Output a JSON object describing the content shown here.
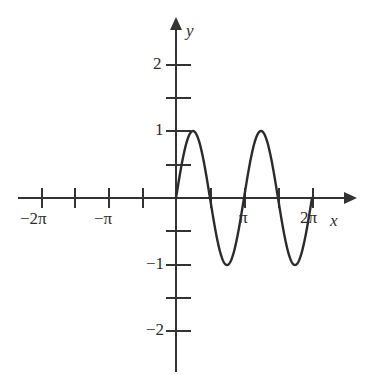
{
  "figure": {
    "background_color": "#ffffff",
    "stroke_color": "#333333",
    "curve_color": "#2b2b2b"
  },
  "axes": {
    "x_axis_label": "x",
    "y_axis_label": "y",
    "x_tick_labels": [
      {
        "text": "−2π",
        "value": -6.283185
      },
      {
        "text": "−π",
        "value": -3.141593
      },
      {
        "text": "π",
        "value": 3.141593
      },
      {
        "text": "2π",
        "value": 6.283185
      }
    ],
    "y_tick_labels": [
      {
        "text": "2",
        "value": 2
      },
      {
        "text": "1",
        "value": 1
      },
      {
        "text": "−1",
        "value": -1
      },
      {
        "text": "−2",
        "value": -2
      }
    ]
  },
  "chart_data": {
    "type": "line",
    "title": "",
    "xlabel": "x",
    "ylabel": "y",
    "xlim": [
      -7.5,
      7.5
    ],
    "ylim": [
      -2.6,
      2.6
    ],
    "grid": false,
    "legend": null,
    "series": [
      {
        "name": "y = sin(2x)",
        "domain": [
          0,
          6.283185
        ],
        "amplitude": 1,
        "period": 3.141593,
        "x": [
          0,
          0.1963,
          0.3927,
          0.589,
          0.7854,
          0.9817,
          1.1781,
          1.3744,
          1.5708,
          1.7671,
          1.9635,
          2.1598,
          2.3562,
          2.5525,
          2.7489,
          2.9452,
          3.1416,
          3.3379,
          3.5343,
          3.7306,
          3.927,
          4.1233,
          4.3197,
          4.516,
          4.7124,
          4.9087,
          5.1051,
          5.3014,
          5.4978,
          5.6941,
          5.8905,
          6.0868,
          6.2832
        ],
        "y": [
          0,
          0.3827,
          0.7071,
          0.9239,
          1,
          0.9239,
          0.7071,
          0.3827,
          0,
          -0.3827,
          -0.7071,
          -0.9239,
          -1,
          -0.9239,
          -0.7071,
          -0.3827,
          0,
          0.3827,
          0.7071,
          0.9239,
          1,
          0.9239,
          0.7071,
          0.3827,
          0,
          -0.3827,
          -0.7071,
          -0.9239,
          -1,
          -0.9239,
          -0.7071,
          -0.3827,
          0
        ]
      }
    ],
    "x_ticks": [
      -6.283185,
      -4.712389,
      -3.141593,
      -1.570796,
      1.570796,
      3.141593,
      4.712389,
      6.283185
    ],
    "y_ticks": [
      -2,
      -1.5,
      -1,
      -0.5,
      0.5,
      1,
      1.5,
      2
    ],
    "annotations": [
      {
        "text": "peak",
        "x": 0.7854,
        "y": 1
      },
      {
        "text": "trough",
        "x": 2.3562,
        "y": -1
      },
      {
        "text": "peak",
        "x": 3.927,
        "y": 1
      },
      {
        "text": "trough",
        "x": 5.4978,
        "y": -1
      }
    ]
  }
}
